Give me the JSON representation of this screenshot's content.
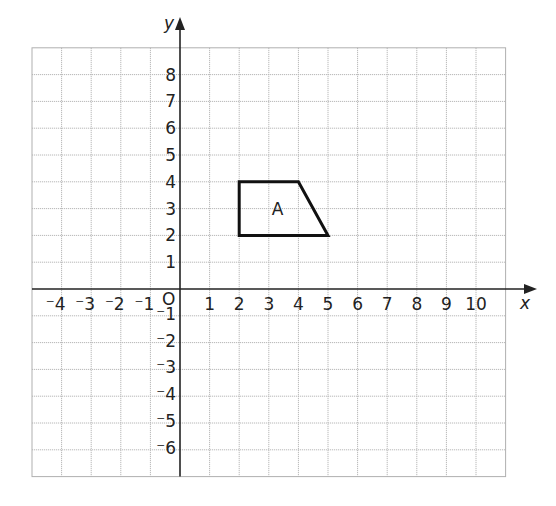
{
  "chart_data": {
    "type": "coordinate-grid",
    "title": "",
    "xlabel": "x",
    "ylabel": "y",
    "xlim": [
      -5,
      11
    ],
    "ylim": [
      -7,
      9
    ],
    "grid": true,
    "origin_label": "O",
    "x_tick_labels": [
      {
        "value": -4,
        "label": "⁻4"
      },
      {
        "value": -3,
        "label": "⁻3"
      },
      {
        "value": -2,
        "label": "⁻2"
      },
      {
        "value": -1,
        "label": "⁻1"
      },
      {
        "value": 1,
        "label": "1"
      },
      {
        "value": 2,
        "label": "2"
      },
      {
        "value": 3,
        "label": "3"
      },
      {
        "value": 4,
        "label": "4"
      },
      {
        "value": 5,
        "label": "5"
      },
      {
        "value": 6,
        "label": "6"
      },
      {
        "value": 7,
        "label": "7"
      },
      {
        "value": 8,
        "label": "8"
      },
      {
        "value": 9,
        "label": "9"
      },
      {
        "value": 10,
        "label": "10"
      }
    ],
    "y_tick_labels": [
      {
        "value": 8,
        "label": "8"
      },
      {
        "value": 7,
        "label": "7"
      },
      {
        "value": 6,
        "label": "6"
      },
      {
        "value": 5,
        "label": "5"
      },
      {
        "value": 4,
        "label": "4"
      },
      {
        "value": 3,
        "label": "3"
      },
      {
        "value": 2,
        "label": "2"
      },
      {
        "value": 1,
        "label": "1"
      },
      {
        "value": -1,
        "label": "⁻1"
      },
      {
        "value": -2,
        "label": "⁻2"
      },
      {
        "value": -3,
        "label": "⁻3"
      },
      {
        "value": -4,
        "label": "⁻4"
      },
      {
        "value": -5,
        "label": "⁻5"
      },
      {
        "value": -6,
        "label": "⁻6"
      }
    ],
    "shapes": [
      {
        "label": "A",
        "type": "trapezium",
        "vertices": [
          [
            2,
            4
          ],
          [
            4,
            4
          ],
          [
            5,
            2
          ],
          [
            2,
            2
          ]
        ],
        "label_position": [
          3.3,
          3
        ]
      }
    ]
  },
  "colors": {
    "grid": "#b8b8b8",
    "axis": "#222222",
    "shape_stroke": "#111111",
    "background": "#ffffff"
  }
}
